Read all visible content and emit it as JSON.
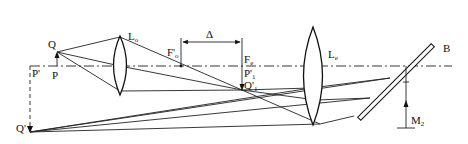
{
  "figure": {
    "type": "optical-diagram"
  },
  "labels": {
    "Q": "Q",
    "P": "P",
    "P_prime": "P'",
    "Q_prime": "Q'",
    "Lo": {
      "main": "L",
      "sub": "o"
    },
    "Le": {
      "main": "L",
      "sub": "e"
    },
    "Fo_prime": {
      "main": "F'",
      "sub": "o"
    },
    "Fe": {
      "main": "F",
      "sub": "e"
    },
    "P1_prime": {
      "main": "P'",
      "sub": "1"
    },
    "Q1_prime": {
      "main": "Q'",
      "sub": "1"
    },
    "Delta": "Δ",
    "B": "B",
    "M2": {
      "main": "M",
      "sub": "2"
    }
  },
  "elements": {
    "optical_axis": "dash-dot horizontal line",
    "objective_lens": "Lo",
    "eyepiece_lens": "Le",
    "beam_splitter_plate": "B",
    "mirror_scale": "M2"
  }
}
